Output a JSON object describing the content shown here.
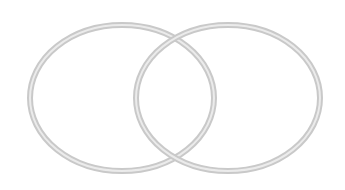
{
  "diagram": {
    "type": "venn",
    "sets": [
      {
        "name": "left-set",
        "cx": 122,
        "cy": 98,
        "rx": 92,
        "ry": 73
      },
      {
        "name": "right-set",
        "cx": 228,
        "cy": 98,
        "rx": 92,
        "ry": 73
      }
    ],
    "colors": {
      "stroke_outer": "#c9c9c9",
      "stroke_inner": "#ebebeb",
      "background": "#ffffff"
    }
  }
}
